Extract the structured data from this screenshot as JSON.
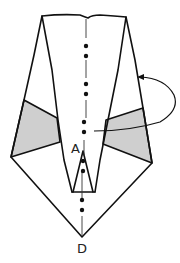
{
  "diagram": {
    "type": "origami-fold-diagram",
    "labels": {
      "point_a": "A",
      "point_d": "D"
    },
    "colors": {
      "line": "#111111",
      "shade": "#cfcfcf",
      "paper": "#ffffff"
    },
    "elements": [
      "paper-outline",
      "left-shaded-flap",
      "right-shaded-flap",
      "inner-kite-point",
      "center-dash-dot-line",
      "fold-behind-arrow"
    ],
    "instruction_icons": [
      "fold-behind-arrow-icon",
      "mountain-fold-line-icon"
    ]
  }
}
